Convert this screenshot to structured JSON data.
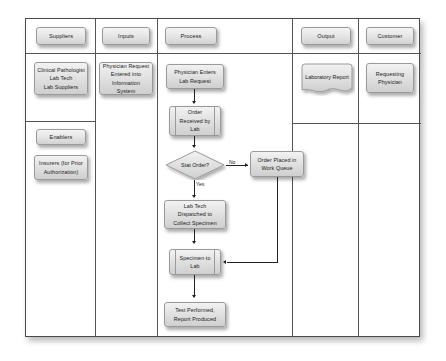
{
  "diagram": {
    "type": "sipoc-flowchart",
    "columns": [
      {
        "id": "suppliers",
        "label": "Suppliers"
      },
      {
        "id": "inputs",
        "label": "Inputs"
      },
      {
        "id": "process",
        "label": "Process"
      },
      {
        "id": "output",
        "label": "Output"
      },
      {
        "id": "customer",
        "label": "Customer"
      }
    ],
    "suppliers": {
      "primary": {
        "line1": "Clinical Pathologist",
        "line2": "Lab Tech",
        "line3": "Lab Suppliers"
      },
      "enablers_header": "Enablers",
      "enablers": {
        "line1": "Insurers (for Prior",
        "line2": "Authorization)"
      }
    },
    "inputs": {
      "request": {
        "line1": "Physician Request",
        "line2": "Entered into",
        "line3": "Information System"
      }
    },
    "process": {
      "step1": {
        "line1": "Physician Enters",
        "line2": "Lab Request"
      },
      "step2": {
        "line1": "Order",
        "line2": "Received by",
        "line3": "Lab"
      },
      "decision": {
        "label": "Stat Order?"
      },
      "branch_no": "No",
      "branch_yes": "Yes",
      "work_queue": {
        "line1": "Order Placed in",
        "line2": "Work Queue"
      },
      "step3": {
        "line1": "Lab Tech",
        "line2": "Dispatched to",
        "line3": "Collect Specimen"
      },
      "step4": {
        "line1": "Specimen to",
        "line2": "Lab"
      },
      "step5": {
        "line1": "Test Performed,",
        "line2": "Report Produced"
      }
    },
    "output": {
      "report": "Laboratory Report"
    },
    "customer": {
      "physician": {
        "line1": "Requesting",
        "line2": "Physician"
      }
    },
    "colors": {
      "frame_border": "#4a4a4a",
      "grid_line": "#555555",
      "node_fill_top": "#f2f2f2",
      "node_fill_bottom": "#cfcfcf",
      "node_border": "#9a9a9a",
      "connector": "#222222",
      "text": "#1a1a1a",
      "background": "#ffffff"
    }
  }
}
